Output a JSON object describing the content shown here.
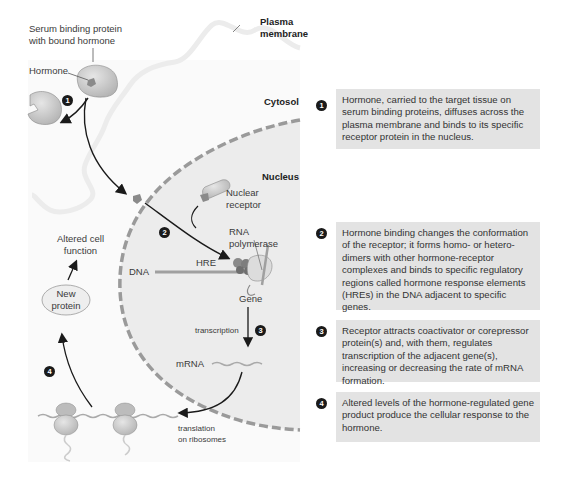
{
  "diagram": {
    "labels": {
      "serum_binding_protein": [
        "Serum binding protein",
        "with bound hormone"
      ],
      "hormone": "Hormone",
      "plasma_membrane": [
        "Plasma",
        "membrane"
      ],
      "cytosol": "Cytosol",
      "nucleus": "Nucleus",
      "nuclear_receptor": [
        "Nuclear",
        "receptor"
      ],
      "rna_polymerase": [
        "RNA",
        "polymerase"
      ],
      "dna": "DNA",
      "hre": "HRE",
      "gene": "Gene",
      "transcription": "transcription",
      "mrna": "mRNA",
      "translation": [
        "translation",
        "on ribosomes"
      ],
      "altered_cell_function": [
        "Altered cell",
        "function"
      ],
      "new_protein": [
        "New",
        "protein"
      ]
    },
    "step_markers": [
      "1",
      "2",
      "3",
      "4"
    ],
    "colors": {
      "nucleus_fill": "#ececec",
      "nucleus_border": "#9a9a9a",
      "protein_fill": "#c8c8c8",
      "hormone_fill": "#8a8a8a",
      "box_fill": "#e3e3e3",
      "marker": "#1a1a1a"
    }
  },
  "steps": [
    {
      "number": "1",
      "text": "Hormone, carried to the target tissue on serum binding proteins, diffuses across the plasma membrane and binds to its specific receptor protein in the nucleus."
    },
    {
      "number": "2",
      "text": "Hormone binding changes the conformation of the receptor; it forms homo- or hetero-dimers with other hormone-receptor complexes and binds to specific regulatory regions called hormone response elements (HREs) in the DNA adjacent to specific genes."
    },
    {
      "number": "3",
      "text": "Receptor attracts coactivator or corepressor protein(s) and, with them, regulates transcription of the adjacent gene(s), increasing or decreasing the rate of mRNA formation."
    },
    {
      "number": "4",
      "text": "Altered levels of the hormone-regulated gene product produce the cellular response to the hormone."
    }
  ]
}
